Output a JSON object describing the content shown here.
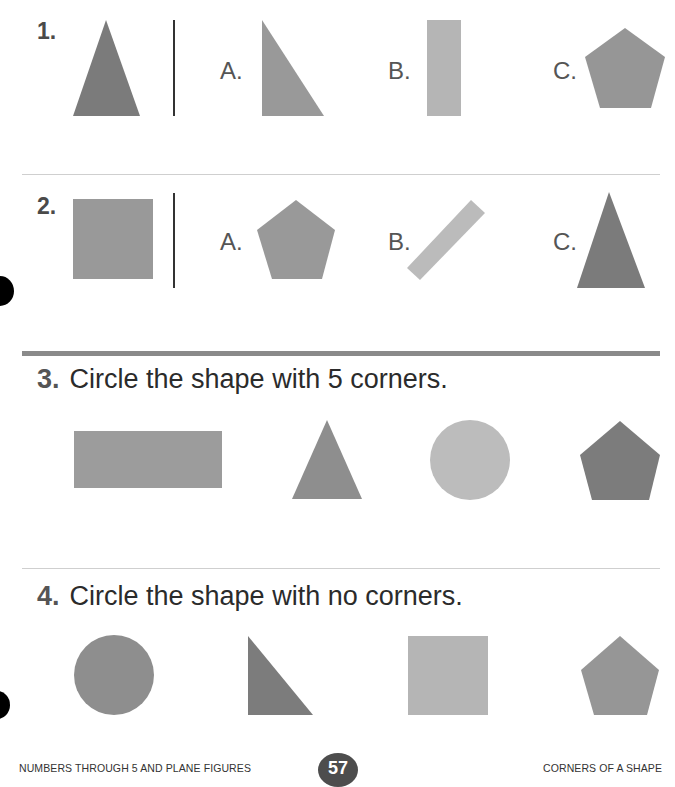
{
  "questions": [
    {
      "number": "1.",
      "target_shape": "triangle",
      "options": [
        {
          "label": "A.",
          "shape": "right-triangle"
        },
        {
          "label": "B.",
          "shape": "tall-rectangle"
        },
        {
          "label": "C.",
          "shape": "pentagon"
        }
      ]
    },
    {
      "number": "2.",
      "target_shape": "rectangle",
      "options": [
        {
          "label": "A.",
          "shape": "pentagon"
        },
        {
          "label": "B.",
          "shape": "rotated-rectangle"
        },
        {
          "label": "C.",
          "shape": "triangle"
        }
      ]
    },
    {
      "number": "3.",
      "prompt": "Circle the shape with 5 corners.",
      "shapes": [
        "rectangle",
        "triangle",
        "circle",
        "pentagon"
      ]
    },
    {
      "number": "4.",
      "prompt": "Circle the shape with no corners.",
      "shapes": [
        "circle",
        "right-triangle",
        "square",
        "pentagon"
      ]
    }
  ],
  "footer": {
    "left": "NUMBERS THROUGH 5 AND PLANE FIGURES",
    "page_number": "57",
    "right": "CORNERS OF A SHAPE"
  },
  "colors": {
    "dark_gray": "#7a7a7a",
    "mid_gray": "#9a9a9a",
    "light_gray": "#b8b8b8"
  }
}
